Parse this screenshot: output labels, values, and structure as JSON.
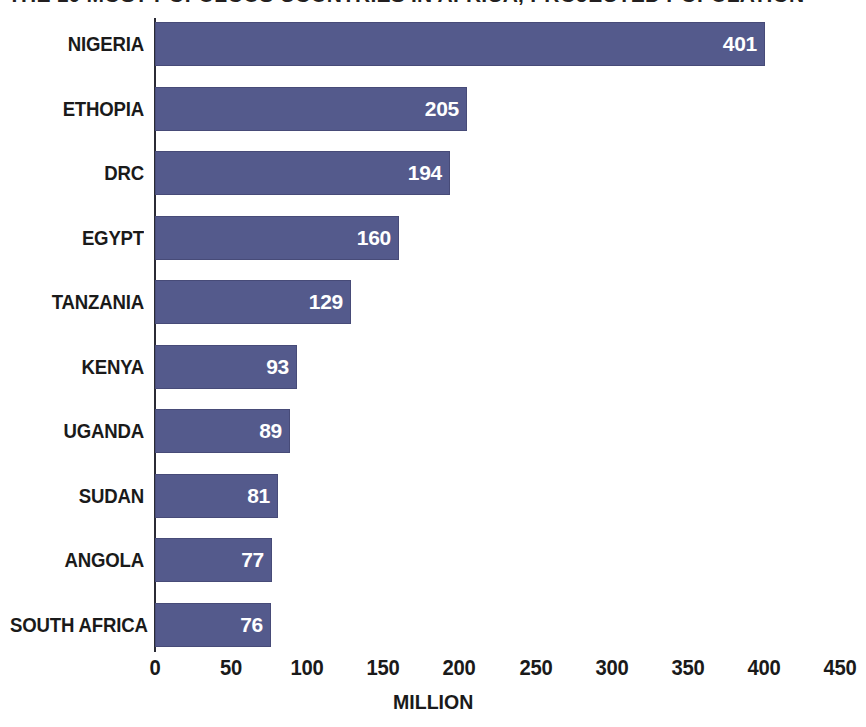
{
  "title": {
    "text": "THE 10 MOST POPULOUS COUNTRIES IN AFRICA, PROJECTED POPULATION",
    "visible": "cropped"
  },
  "axis": {
    "x_title": "MILLION",
    "ticks": [
      "0",
      "50",
      "100",
      "150",
      "200",
      "250",
      "300",
      "350",
      "400",
      "450"
    ]
  },
  "colors": {
    "bar": "#545a8c",
    "bar_label": "#ffffff",
    "category_label": "#1a1a1a",
    "axis": "#2b2b35",
    "background": "#ffffff"
  },
  "chart_data": {
    "type": "bar",
    "orientation": "horizontal",
    "title": "",
    "xlabel": "MILLION",
    "ylabel": "",
    "xlim": [
      0,
      450
    ],
    "grid": false,
    "legend": false,
    "categories": [
      "NIGERIA",
      "ETHOPIA",
      "DRC",
      "EGYPT",
      "TANZANIA",
      "KENYA",
      "UGANDA",
      "SUDAN",
      "ANGOLA",
      "SOUTH AFRICA"
    ],
    "values": [
      401,
      205,
      194,
      160,
      129,
      93,
      89,
      81,
      77,
      76
    ],
    "value_labels": [
      "401",
      "205",
      "194",
      "160",
      "129",
      "93",
      "89",
      "81",
      "77",
      "76"
    ],
    "tick_values": [
      0,
      50,
      100,
      150,
      200,
      250,
      300,
      350,
      400,
      450
    ],
    "tick_labels": [
      "0",
      "50",
      "100",
      "150",
      "200",
      "250",
      "300",
      "350",
      "400",
      "450"
    ]
  }
}
